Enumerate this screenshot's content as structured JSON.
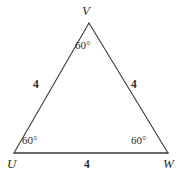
{
  "figure": {
    "type": "equilateral-triangle-diagram",
    "stroke_color": "#3a3a3a",
    "background_color": "#ffffff",
    "text_color": "#2b2b2b",
    "vertices": {
      "V": {
        "label": "V",
        "x": 89,
        "y": 23
      },
      "U": {
        "label": "U",
        "x": 14,
        "y": 153
      },
      "W": {
        "label": "W",
        "x": 168,
        "y": 153
      }
    },
    "angles": {
      "at_V": "60°",
      "at_U": "60°",
      "at_W": "60°"
    },
    "sides": {
      "UV": "4",
      "VW": "4",
      "UW": "4"
    }
  }
}
